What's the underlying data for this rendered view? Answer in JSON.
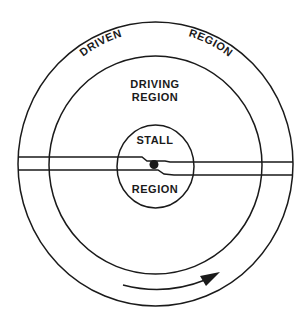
{
  "diagram": {
    "type": "concentric-regions",
    "colors": {
      "line": "#1a1a1a",
      "background": "#ffffff"
    },
    "regions": {
      "outer": {
        "label_left": "DRIVEN",
        "label_right": "REGION"
      },
      "middle": {
        "line1": "DRIVING",
        "line2": "REGION"
      },
      "inner": {
        "top": "STALL",
        "bottom": "REGION"
      }
    },
    "center_marker": "dot",
    "rotation_arrow": "clockwise-arrow"
  }
}
